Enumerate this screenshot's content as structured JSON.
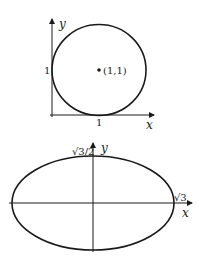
{
  "figures": [
    {
      "id": "circle",
      "axes": {
        "x_label": "x",
        "y_label": "y"
      },
      "ticks": {
        "x_tick": "1",
        "y_tick": "1"
      },
      "center_label": "(1,1)",
      "shape": "circle",
      "center": [
        1,
        1
      ],
      "radius": 1
    },
    {
      "id": "ellipse",
      "axes": {
        "x_label": "x",
        "y_label": "y"
      },
      "ticks": {
        "x_tick": "√3",
        "y_tick": "√3/2"
      },
      "shape": "ellipse",
      "semi_axes": [
        "√3",
        "√3/2"
      ]
    }
  ],
  "colors": {
    "stroke": "#1a1a1a",
    "background": "#ffffff"
  }
}
